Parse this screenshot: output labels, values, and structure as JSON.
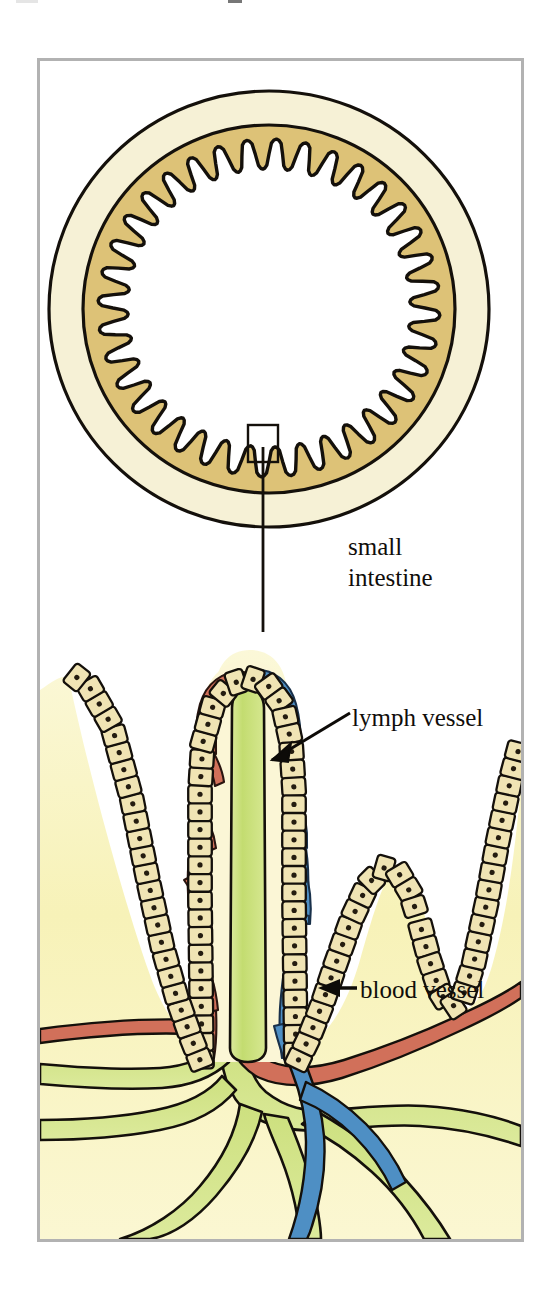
{
  "figure": {
    "labels": {
      "organ_line1": "small",
      "organ_line2": "intestine",
      "lymph": "lymph vessel",
      "blood": "blood vessel"
    },
    "icons": {
      "zoom_box": "selection-box-icon",
      "leader": "leader-line-icon",
      "lymph_pointer": "arrow-pointer-icon",
      "blood_pointer": "arrow-left-icon"
    }
  },
  "colors": {
    "frame_border": "#b2b2b2",
    "page_background": "#ffffff",
    "serosa_cream": "#f6f1d6",
    "muscle_tan": "#ddc277",
    "lumen_white": "#ffffff",
    "lamina_yellow": "#f8f4c0",
    "epithelial_cell": "#f0e4b4",
    "nucleus": "#241c10",
    "lymph_green": "#c4dc76",
    "artery_red": "#d1705a",
    "vein_blue": "#4e8fc4",
    "ink": "#100d0a",
    "label_text": "#100d0a"
  },
  "cross_section": {
    "center_x": 269,
    "center_y": 308,
    "outer_radius_x": 221,
    "outer_radius_y": 219,
    "serosa_thickness": 34,
    "muscle_thickness": 46,
    "villi_count": 36,
    "villi_tooth_depth": 30,
    "selection_box": {
      "x": 248,
      "y": 425,
      "width": 30,
      "height": 37
    },
    "leader_line": {
      "x": 263,
      "y_top": 462,
      "y_bottom": 632
    }
  },
  "villus_detail": {
    "panel": {
      "x": 40,
      "y": 632,
      "width": 481,
      "height": 607
    },
    "central_villus": {
      "tip_x": 247,
      "tip_y": 648,
      "half_width": 62,
      "base_y": 1060
    },
    "epithelium": {
      "cell_count_per_side": 27,
      "cell_size": 19,
      "nucleus_radius": 2.6
    },
    "lacteal": {
      "label": "lymph vessel",
      "color": "#c4dc76",
      "width": 26
    },
    "capillary_arterial": {
      "label": "blood vessel",
      "color": "#d1705a"
    },
    "capillary_venous": {
      "label": "blood vessel",
      "color": "#4e8fc4"
    },
    "neighbor_villi": [
      {
        "side": "left",
        "tip_x": 62,
        "tip_y": 690
      },
      {
        "side": "right",
        "tip_x": 455,
        "tip_y": 760
      },
      {
        "side": "right-small",
        "tip_x": 392,
        "tip_y": 880
      }
    ]
  }
}
